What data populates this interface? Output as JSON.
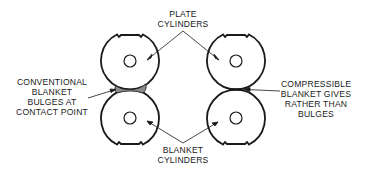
{
  "diagram": {
    "labels": {
      "plate": [
        "PLATE",
        "CYLINDERS"
      ],
      "blanket": [
        "BLANKET",
        "CYLINDERS"
      ],
      "conventional": [
        "CONVENTIONAL",
        "BLANKET",
        "BULGES AT",
        "CONTACT POINT"
      ],
      "compressible": [
        "COMPRESSIBLE",
        "BLANKET GIVES",
        "RATHER THAN",
        "BULGES"
      ]
    },
    "cylinders": [
      {
        "id": "left-plate",
        "cx": 130,
        "cy": 61,
        "r": 29,
        "notch": "top"
      },
      {
        "id": "left-blanket",
        "cx": 130,
        "cy": 118,
        "r": 29,
        "notch": "bottom"
      },
      {
        "id": "right-plate",
        "cx": 236,
        "cy": 61,
        "r": 29,
        "notch": "top"
      },
      {
        "id": "right-blanket",
        "cx": 236,
        "cy": 118,
        "r": 29,
        "notch": "bottom"
      }
    ],
    "colors": {
      "line": "#1a1a1a",
      "bulge": "#8a8a8a",
      "background": "#ffffff"
    }
  }
}
